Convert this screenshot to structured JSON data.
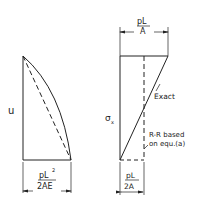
{
  "left_diagram": {
    "axis_label": "u",
    "dimension": {
      "numerator": "pL",
      "superscript": "2",
      "denominator": "2AE"
    }
  },
  "right_diagram": {
    "axis_label": "σ",
    "axis_label_sub": "x",
    "top_dimension": {
      "numerator": "pL",
      "denominator": "A"
    },
    "bottom_dimension": {
      "numerator": "pL",
      "denominator": "2A"
    },
    "annotations": {
      "exact": "Exact",
      "rr_line1": "R-R based",
      "rr_line2": "on equ.(a)"
    }
  },
  "colors": {
    "stroke": "#222222",
    "background": "#ffffff"
  }
}
